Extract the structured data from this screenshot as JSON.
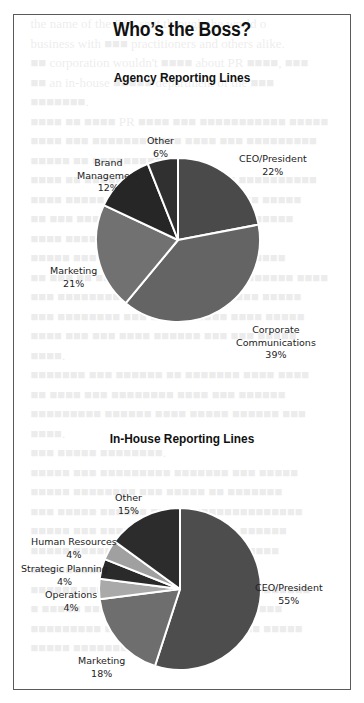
{
  "document": {
    "title": "Who’s the Boss?"
  },
  "charts": {
    "agency": {
      "subtitle": "Agency Reporting Lines",
      "labels": [
        {
          "name": "CEO/President",
          "pct": "22%"
        },
        {
          "name": "Corporate",
          "name2": "Communications",
          "pct": "39%"
        },
        {
          "name": "Marketing",
          "pct": "21%"
        },
        {
          "name": "Brand",
          "name2": "Management",
          "pct": "12%"
        },
        {
          "name": "Other",
          "pct": "6%"
        }
      ]
    },
    "inhouse": {
      "subtitle": "In-House Reporting Lines",
      "labels": [
        {
          "name": "CEO/President",
          "pct": "55%"
        },
        {
          "name": "Marketing",
          "pct": "18%"
        },
        {
          "name": "Operations",
          "pct": "4%"
        },
        {
          "name": "Strategic Planning",
          "pct": "4%"
        },
        {
          "name": "Human Resources",
          "pct": "4%"
        },
        {
          "name": "Other",
          "pct": "15%"
        }
      ]
    }
  },
  "chart_data": [
    {
      "type": "pie",
      "title": "Agency Reporting Lines",
      "categories": [
        "CEO/President",
        "Corporate Communications",
        "Marketing",
        "Brand Management",
        "Other"
      ],
      "values": [
        22,
        39,
        21,
        12,
        6
      ],
      "unit": "%",
      "colors": [
        "#4a4a4a",
        "#646464",
        "#717171",
        "#262626",
        "#303030"
      ],
      "start_angle": "12 o'clock, clockwise",
      "legend": "none (direct labels)"
    },
    {
      "type": "pie",
      "title": "In-House Reporting Lines",
      "categories": [
        "CEO/President",
        "Marketing",
        "Operations",
        "Strategic Planning",
        "Human Resources",
        "Other"
      ],
      "values": [
        55,
        18,
        4,
        4,
        4,
        15
      ],
      "unit": "%",
      "colors": [
        "#4d4d4d",
        "#6e6e6e",
        "#a9a9a9",
        "#2a2a2a",
        "#a0a0a0",
        "#2c2c2c"
      ],
      "start_angle": "12 o'clock, clockwise",
      "legend": "none (direct labels)"
    }
  ]
}
